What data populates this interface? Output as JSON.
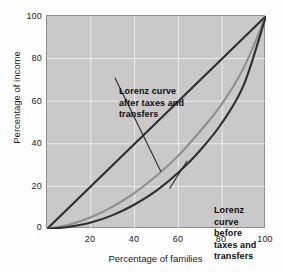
{
  "chart_data": {
    "type": "line",
    "title": "",
    "xlabel": "Percentage of families",
    "ylabel": "Percentage of income",
    "xlim": [
      0,
      100
    ],
    "ylim": [
      0,
      100
    ],
    "xticks": [
      "20",
      "40",
      "60",
      "80",
      "100"
    ],
    "yticks": [
      "0",
      "20",
      "40",
      "60",
      "80",
      "100"
    ],
    "grid": true,
    "legend_position": "in-plot annotations",
    "series": [
      {
        "name": "Line of perfect equality",
        "color": "#2f2f2f",
        "x": [
          0,
          20,
          40,
          60,
          80,
          100
        ],
        "values": [
          0,
          20,
          40,
          60,
          80,
          100
        ]
      },
      {
        "name": "Lorenz curve after taxes and transfers",
        "color": "#8f8f8f",
        "x": [
          0,
          10,
          20,
          30,
          40,
          50,
          60,
          70,
          80,
          90,
          100
        ],
        "values": [
          0,
          2,
          5.5,
          10.5,
          17,
          25,
          34.5,
          46,
          59,
          76,
          100
        ]
      },
      {
        "name": "Lorenz curve before taxes and transfers",
        "color": "#2f2f2f",
        "x": [
          0,
          10,
          20,
          30,
          40,
          50,
          60,
          70,
          80,
          90,
          100
        ],
        "values": [
          0,
          1,
          3,
          6.5,
          11.5,
          18,
          26.5,
          37,
          50,
          68,
          100
        ]
      }
    ],
    "annotations": [
      {
        "id": "after",
        "text": "Lorenz curve\nafter taxes and\ntransfers",
        "leader_from": [
          31,
          71
        ],
        "leader_to": [
          52,
          27
        ]
      },
      {
        "id": "before",
        "text": "Lorenz curve\nbefore taxes and\ntransfers",
        "leader_from": [
          56,
          19
        ],
        "leader_to": [
          64,
          32
        ]
      }
    ]
  },
  "axes": {
    "ylabel": "Percentage of income",
    "xlabel": "Percentage of families",
    "yticks": [
      {
        "label": "100",
        "value": 100
      },
      {
        "label": "80",
        "value": 80
      },
      {
        "label": "60",
        "value": 60
      },
      {
        "label": "40",
        "value": 40
      },
      {
        "label": "20",
        "value": 20
      },
      {
        "label": "0",
        "value": 0
      }
    ],
    "xticks": [
      {
        "label": "20",
        "value": 20
      },
      {
        "label": "40",
        "value": 40
      },
      {
        "label": "60",
        "value": 60
      },
      {
        "label": "80",
        "value": 80
      },
      {
        "label": "100",
        "value": 100
      }
    ]
  },
  "annotations": {
    "after": "Lorenz curve\nafter taxes and\ntransfers",
    "before": "Lorenz curve\nbefore taxes and\ntransfers"
  },
  "colors": {
    "plot_background": "#c9c9c9",
    "page_background": "#fefefe",
    "grid": "#eaeaea",
    "frame": "#8e8e8e",
    "curve_dark": "#2f2f2f",
    "curve_gray": "#8f8f8f",
    "text": "#1b1b1b"
  }
}
